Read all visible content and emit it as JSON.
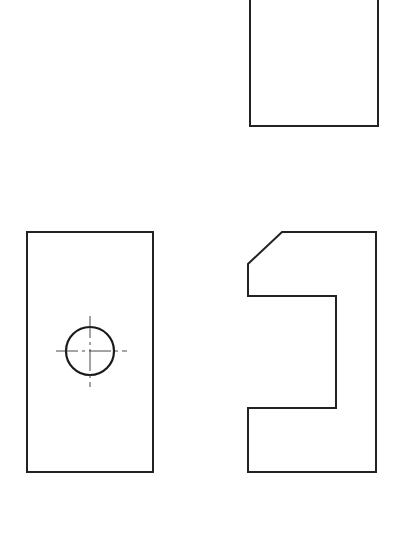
{
  "drawing": {
    "type": "orthographic-projection",
    "stroke_color": "#222222",
    "background": "#ffffff",
    "views": {
      "top_view": {
        "label": "",
        "rect": {
          "x": 250,
          "y": -5,
          "width": 128,
          "height": 131
        }
      },
      "front_view": {
        "label": "",
        "rect": {
          "x": 27,
          "y": 232,
          "width": 126,
          "height": 240
        },
        "hole": {
          "cx": 90,
          "cy": 351,
          "r": 24
        },
        "centerlines": {
          "horizontal": {
            "x1": 56,
            "x2": 127,
            "y": 351
          },
          "vertical": {
            "y1": 316,
            "y2": 387,
            "x": 90
          }
        }
      },
      "side_view": {
        "label": "",
        "profile_points": [
          [
            282,
            232
          ],
          [
            376,
            232
          ],
          [
            376,
            472
          ],
          [
            248,
            472
          ],
          [
            248,
            408
          ],
          [
            336,
            408
          ],
          [
            336,
            296
          ],
          [
            248,
            296
          ],
          [
            248,
            264
          ]
        ]
      }
    }
  }
}
